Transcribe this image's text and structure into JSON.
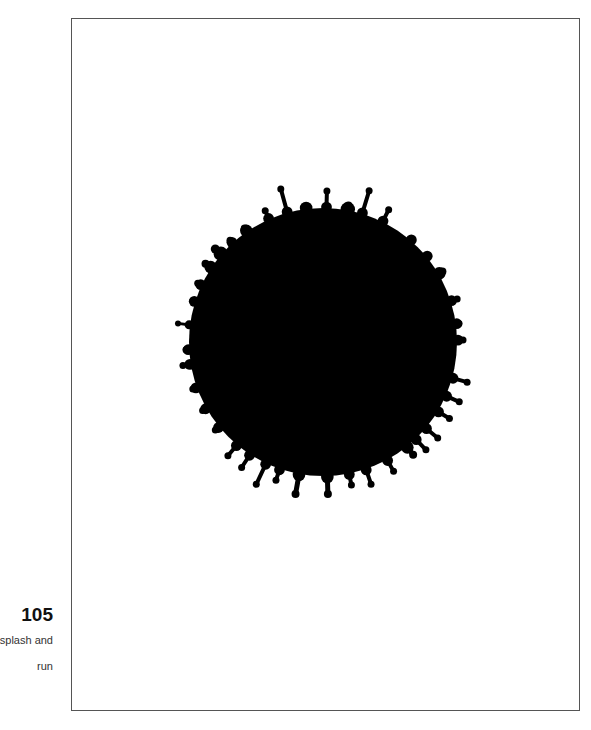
{
  "page": {
    "number": "105",
    "caption_lines": [
      "splash and",
      "run"
    ]
  },
  "colors": {
    "ink": "#000000",
    "frame": "#555555",
    "background": "#ffffff"
  },
  "illustration": {
    "name": "ink-splash",
    "center": [
      323,
      342
    ],
    "radius": 134,
    "drips": [
      [
        280,
        186,
        6
      ],
      [
        327,
        188,
        6
      ],
      [
        370,
        188,
        6
      ],
      [
        306,
        207,
        7
      ],
      [
        264,
        208,
        6
      ],
      [
        243,
        226,
        7
      ],
      [
        213,
        247,
        8
      ],
      [
        349,
        203,
        8
      ],
      [
        390,
        207,
        6
      ],
      [
        413,
        238,
        6
      ],
      [
        425,
        258,
        6
      ],
      [
        445,
        270,
        7
      ],
      [
        460,
        298,
        6
      ],
      [
        462,
        323,
        6
      ],
      [
        466,
        340,
        6
      ],
      [
        470,
        383,
        6
      ],
      [
        462,
        403,
        6
      ],
      [
        452,
        420,
        6
      ],
      [
        440,
        440,
        6
      ],
      [
        428,
        452,
        6
      ],
      [
        415,
        457,
        7
      ],
      [
        395,
        474,
        6
      ],
      [
        372,
        487,
        6
      ],
      [
        352,
        488,
        6
      ],
      [
        328,
        497,
        7
      ],
      [
        295,
        497,
        7
      ],
      [
        275,
        483,
        6
      ],
      [
        255,
        487,
        6
      ],
      [
        240,
        470,
        6
      ],
      [
        226,
        458,
        6
      ],
      [
        213,
        432,
        6
      ],
      [
        200,
        412,
        6
      ],
      [
        190,
        390,
        6
      ],
      [
        180,
        366,
        6
      ],
      [
        183,
        350,
        6
      ],
      [
        175,
        323,
        5
      ],
      [
        190,
        300,
        6
      ],
      [
        195,
        282,
        6
      ],
      [
        203,
        262,
        7
      ],
      [
        228,
        238,
        6
      ]
    ]
  }
}
